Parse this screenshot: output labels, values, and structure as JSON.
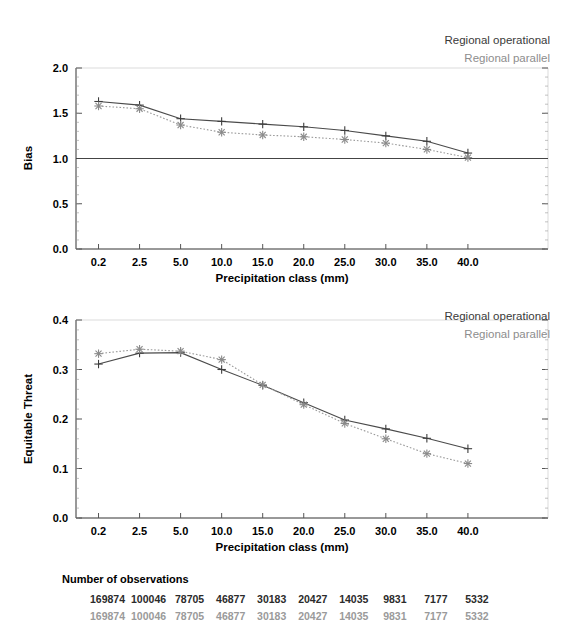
{
  "figure": {
    "top_cut_title": "",
    "observations": {
      "title": "Number of observations",
      "operational": [
        "169874",
        "100046",
        "78705",
        "46877",
        "30183",
        "20427",
        "14035",
        "9831",
        "7177",
        "5332"
      ],
      "parallel": [
        "169874",
        "100046",
        "78705",
        "46877",
        "30183",
        "20427",
        "14035",
        "9831",
        "7177",
        "5332"
      ]
    },
    "colors": {
      "operational": "#3d3d3d",
      "parallel": "#9a9a9a",
      "axis": "#333333",
      "background": "#ffffff"
    }
  },
  "chart_data": [
    {
      "type": "line",
      "id": "bias-chart",
      "title": "",
      "xlabel": "Precipitation class (mm)",
      "ylabel": "Bias",
      "categories": [
        "0.2",
        "2.5",
        "5.0",
        "10.0",
        "15.0",
        "20.0",
        "25.0",
        "30.0",
        "35.0",
        "40.0"
      ],
      "ylim": [
        0.0,
        2.0
      ],
      "yticks": [
        "0.0",
        "0.5",
        "1.0",
        "1.5",
        "2.0"
      ],
      "grid": false,
      "reference_line": 1.0,
      "legend_position": "top-right",
      "series": [
        {
          "name": "Regional operational",
          "marker": "plus",
          "linestyle": "solid",
          "color": "#3d3d3d",
          "values": [
            1.63,
            1.59,
            1.44,
            1.41,
            1.38,
            1.35,
            1.31,
            1.25,
            1.19,
            1.06
          ]
        },
        {
          "name": "Regional parallel",
          "marker": "asterisk",
          "linestyle": "dotted",
          "color": "#9a9a9a",
          "values": [
            1.58,
            1.55,
            1.37,
            1.29,
            1.26,
            1.24,
            1.21,
            1.17,
            1.1,
            1.01
          ]
        }
      ]
    },
    {
      "type": "line",
      "id": "equitable-threat-chart",
      "title": "",
      "xlabel": "Precipitation class (mm)",
      "ylabel": "Equitable Threat",
      "categories": [
        "0.2",
        "2.5",
        "5.0",
        "10.0",
        "15.0",
        "20.0",
        "25.0",
        "30.0",
        "35.0",
        "40.0"
      ],
      "ylim": [
        0.0,
        0.4
      ],
      "yticks": [
        "0.0",
        "0.1",
        "0.2",
        "0.3",
        "0.4"
      ],
      "grid": false,
      "legend_position": "top-right",
      "series": [
        {
          "name": "Regional operational",
          "marker": "plus",
          "linestyle": "solid",
          "color": "#3d3d3d",
          "values": [
            0.311,
            0.333,
            0.334,
            0.3,
            0.268,
            0.233,
            0.198,
            0.18,
            0.161,
            0.14
          ]
        },
        {
          "name": "Regional parallel",
          "marker": "asterisk",
          "linestyle": "dotted",
          "color": "#9a9a9a",
          "values": [
            0.332,
            0.341,
            0.337,
            0.32,
            0.269,
            0.229,
            0.191,
            0.16,
            0.13,
            0.11
          ]
        }
      ]
    }
  ],
  "legend": {
    "operational_label": "Regional operational",
    "parallel_label": "Regional parallel"
  }
}
